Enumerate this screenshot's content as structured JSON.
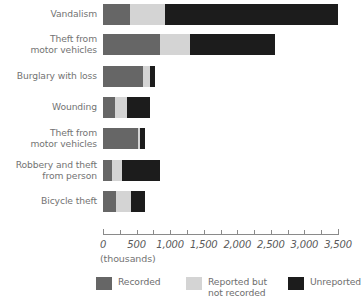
{
  "chart_data": {
    "type": "bar",
    "orientation": "horizontal",
    "stacked": true,
    "title": "",
    "subtitle": "",
    "xlabel": "(thousands)",
    "ylabel": "",
    "xlim": [
      0,
      3500
    ],
    "xticks": [
      0,
      250,
      500,
      750,
      1000,
      1250,
      1500,
      1750,
      2000,
      2250,
      2500,
      2750,
      3000,
      3250,
      3500
    ],
    "xtick_labels": [
      "0",
      "",
      "500",
      "",
      "1,000",
      "",
      "1,500",
      "",
      "2,000",
      "",
      "2,500",
      "",
      "3,000",
      "",
      "3,500"
    ],
    "grid": false,
    "legend_position": "bottom",
    "categories": [
      "Vandalism",
      "Theft from\nmotor vehicles",
      "Burglary with loss",
      "Wounding",
      "Theft from\nmotor vehicles",
      "Robbery and theft\nfrom person",
      "Bicycle theft"
    ],
    "series": [
      {
        "name": "Recorded",
        "color": "#666666",
        "values": [
          400,
          850,
          600,
          180,
          520,
          130,
          200
        ]
      },
      {
        "name": "Reported but\nnot recorded",
        "color": "#d4d4d4",
        "values": [
          520,
          450,
          100,
          180,
          30,
          150,
          220
        ]
      },
      {
        "name": "Unreported",
        "color": "#1c1c1c",
        "values": [
          2580,
          1260,
          80,
          340,
          70,
          570,
          200
        ]
      }
    ]
  },
  "axis": {
    "unit_label": "(thousands)",
    "tick_labels": [
      "0",
      "500",
      "1,000",
      "1,500",
      "2,000",
      "2,500",
      "3,000",
      "3,500"
    ],
    "tick_values": [
      0,
      500,
      1000,
      1500,
      2000,
      2500,
      3000,
      3500
    ]
  },
  "legend": {
    "items": [
      {
        "label": "Recorded",
        "color": "#666666"
      },
      {
        "label": "Reported but\nnot recorded",
        "color": "#d4d4d4"
      },
      {
        "label": "Unreported",
        "color": "#1c1c1c"
      }
    ]
  },
  "colors": {
    "recorded": "#666666",
    "reported_not_recorded": "#d4d4d4",
    "unreported": "#1c1c1c",
    "text": "#6e6e6e",
    "axis": "#8a8a8a",
    "background": "#ffffff"
  }
}
